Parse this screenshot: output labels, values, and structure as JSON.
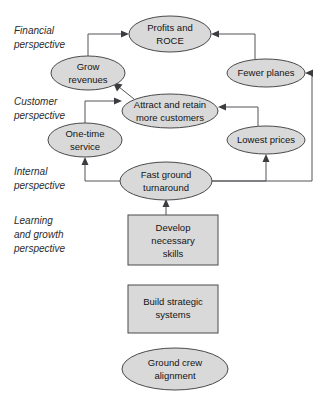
{
  "figure": {
    "title": "",
    "type": "strategy-map",
    "background_color": "#ffffff",
    "node_fill": "#d9d9d9",
    "node_stroke": "#4a4a4a",
    "connector_color": "#55555a",
    "text_color": "#141414"
  },
  "perspectives": [
    {
      "id": "financial",
      "lines": [
        "Financial",
        "perspective"
      ],
      "line1": "Financial",
      "line2": "perspective",
      "line3": ""
    },
    {
      "id": "customer",
      "lines": [
        "Customer",
        "perspective"
      ],
      "line1": "Customer",
      "line2": "perspective",
      "line3": ""
    },
    {
      "id": "internal",
      "lines": [
        "Internal",
        "perspective"
      ],
      "line1": "Internal",
      "line2": "perspective",
      "line3": ""
    },
    {
      "id": "learning",
      "lines": [
        "Learning",
        "and growth",
        "perspective"
      ],
      "line1": "Learning",
      "line2": "and growth",
      "line3": "perspective"
    }
  ],
  "nodes": [
    {
      "id": "profits-and-roce",
      "shape": "ellipse",
      "perspective": "financial",
      "line1": "Profits and",
      "line2": "ROCE",
      "cx": 170,
      "cy": 34,
      "rx": 41,
      "ry": 18
    },
    {
      "id": "grow-revenues",
      "shape": "ellipse",
      "perspective": "financial",
      "line1": "Grow",
      "line2": "revenues",
      "cx": 88,
      "cy": 73,
      "rx": 37,
      "ry": 17
    },
    {
      "id": "fewer-planes",
      "shape": "ellipse",
      "perspective": "financial",
      "line1": "Fewer planes",
      "line2": "",
      "cx": 266,
      "cy": 73,
      "rx": 39,
      "ry": 14
    },
    {
      "id": "attract-and-retain-more-customers",
      "shape": "ellipse",
      "perspective": "customer",
      "line1": "Attract and retain",
      "line2": "more customers",
      "cx": 170,
      "cy": 111,
      "rx": 48,
      "ry": 17
    },
    {
      "id": "one-time-service",
      "shape": "ellipse",
      "perspective": "customer",
      "line1": "One-time",
      "line2": "service",
      "cx": 85,
      "cy": 140,
      "rx": 37,
      "ry": 17
    },
    {
      "id": "lowest-prices",
      "shape": "ellipse",
      "perspective": "customer",
      "line1": "Lowest prices",
      "line2": "",
      "cx": 266,
      "cy": 140,
      "rx": 39,
      "ry": 14
    },
    {
      "id": "fast-ground-turnaround",
      "shape": "ellipse",
      "perspective": "internal",
      "line1": "Fast ground",
      "line2": "turnaround",
      "cx": 166,
      "cy": 181,
      "rx": 46,
      "ry": 19
    },
    {
      "id": "develop-necessary-skills",
      "shape": "rect",
      "perspective": "learning",
      "line1": "Develop",
      "line2": "necessary",
      "line3": "skills",
      "x": 128,
      "y": 215,
      "w": 90,
      "h": 50
    },
    {
      "id": "build-strategic-systems",
      "shape": "rect",
      "perspective": "learning",
      "line1": "Build strategic",
      "line2": "systems",
      "line3": "",
      "x": 128,
      "y": 285,
      "w": 90,
      "h": 48
    },
    {
      "id": "ground-crew-alignment",
      "shape": "ellipse",
      "perspective": "learning",
      "line1": "Ground crew",
      "line2": "alignment",
      "cx": 175,
      "cy": 369,
      "rx": 53,
      "ry": 21
    }
  ],
  "connections": [
    {
      "id": "grow-revenues-to-profits",
      "from": "grow-revenues",
      "to": "profits-and-roce"
    },
    {
      "id": "fewer-planes-to-profits",
      "from": "fewer-planes",
      "to": "profits-and-roce"
    },
    {
      "id": "attract-customers-to-grow-revenues",
      "from": "attract-and-retain-more-customers",
      "to": "grow-revenues"
    },
    {
      "id": "one-time-service-to-attract-customers",
      "from": "one-time-service",
      "to": "attract-and-retain-more-customers"
    },
    {
      "id": "lowest-prices-to-attract-customers",
      "from": "lowest-prices",
      "to": "attract-and-retain-more-customers"
    },
    {
      "id": "fast-ground-turnaround-to-one-time-service",
      "from": "fast-ground-turnaround",
      "to": "one-time-service"
    },
    {
      "id": "fast-ground-turnaround-to-lowest-prices",
      "from": "fast-ground-turnaround",
      "to": "lowest-prices"
    },
    {
      "id": "fast-ground-turnaround-to-fewer-planes",
      "from": "fast-ground-turnaround",
      "to": "fewer-planes"
    },
    {
      "id": "develop-skills-to-fast-ground-turnaround",
      "from": "develop-necessary-skills",
      "to": "fast-ground-turnaround"
    }
  ]
}
